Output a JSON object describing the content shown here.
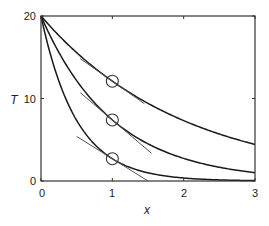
{
  "chart_data": {
    "type": "line",
    "title": "",
    "xlabel": "x",
    "ylabel": "T",
    "xlim": [
      0,
      3
    ],
    "ylim": [
      0,
      20
    ],
    "xticks": [
      "0",
      "1",
      "2",
      "3"
    ],
    "yticks": [
      "0",
      "10",
      "20"
    ],
    "grid": false,
    "legend": null,
    "series": [
      {
        "name": "T = 20 e^(-0.5x)",
        "x": [
          0,
          0.5,
          1,
          1.5,
          2,
          2.5,
          3
        ],
        "values": [
          20,
          15.6,
          12.1,
          9.4,
          7.4,
          5.7,
          4.5
        ]
      },
      {
        "name": "T = 20 e^(-x)",
        "x": [
          0,
          0.5,
          1,
          1.5,
          2,
          2.5,
          3
        ],
        "values": [
          20,
          12.1,
          7.4,
          4.5,
          2.7,
          1.6,
          1.0
        ]
      },
      {
        "name": "T = 20 e^(-2x)",
        "x": [
          0,
          0.5,
          1,
          1.5,
          2,
          2.5,
          3
        ],
        "values": [
          20,
          7.4,
          2.7,
          1.0,
          0.4,
          0.1,
          0.05
        ]
      }
    ],
    "annotations": [
      {
        "type": "circle-marker",
        "x": 1,
        "y": 12.1
      },
      {
        "type": "circle-marker",
        "x": 1,
        "y": 7.4
      },
      {
        "type": "circle-marker",
        "x": 1,
        "y": 2.7
      },
      {
        "type": "tangent-line",
        "at_x": 1,
        "slope": -6.07,
        "x_range": [
          0.55,
          1.45
        ]
      },
      {
        "type": "tangent-line",
        "at_x": 1,
        "slope": -7.36,
        "x_range": [
          0.55,
          1.55
        ]
      },
      {
        "type": "tangent-line",
        "at_x": 1,
        "slope": -5.41,
        "x_range": [
          0.5,
          1.5
        ]
      }
    ]
  },
  "axes": {
    "xlabel": "x",
    "ylabel": "T",
    "xticks": [
      "0",
      "1",
      "2",
      "3"
    ],
    "yticks": [
      "0",
      "10",
      "20"
    ]
  }
}
